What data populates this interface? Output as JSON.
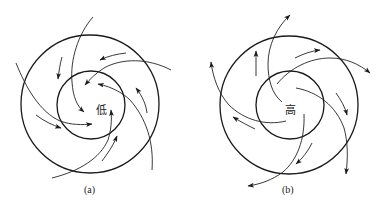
{
  "figure": {
    "panels": [
      {
        "id": "a",
        "caption": "(a)",
        "center_label": "低",
        "meaning": "low-pressure cyclone, inflowing counter-clockwise spiral",
        "outer_circle": {
          "cx": 90,
          "cy": 104,
          "r": 69
        },
        "inner_circle": {
          "cx": 91,
          "cy": 105,
          "r": 34
        }
      },
      {
        "id": "b",
        "caption": "(b)",
        "center_label": "高",
        "meaning": "high-pressure anticyclone, outflowing clockwise spiral",
        "outer_circle": {
          "cx": 289,
          "cy": 105,
          "r": 69
        },
        "inner_circle": {
          "cx": 290,
          "cy": 105,
          "r": 34
        }
      }
    ],
    "stroke_color": "#1a1a1a",
    "background_color": "#ffffff"
  }
}
